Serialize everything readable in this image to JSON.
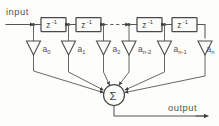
{
  "figure": {
    "kind": "block-diagram",
    "background_color": "#fdfdfc",
    "line_color": "#565656"
  },
  "io": {
    "input_label": "input",
    "output_label": "output"
  },
  "delay_blocks": [
    {
      "id": "delay-0",
      "base": "z",
      "exponent": "-1",
      "text": "z-1"
    },
    {
      "id": "delay-1",
      "base": "z",
      "exponent": "-1",
      "text": "z-1"
    },
    {
      "id": "delay-2",
      "base": "z",
      "exponent": "-1",
      "text": "z-1"
    },
    {
      "id": "delay-3",
      "base": "z",
      "exponent": "-1",
      "text": "z-1"
    }
  ],
  "continuation": {
    "style": "dashed",
    "meaning": "additional delay stages omitted"
  },
  "coefficients": [
    {
      "id": "coef-0",
      "base": "a",
      "subscript": "0",
      "text": "a0"
    },
    {
      "id": "coef-1",
      "base": "a",
      "subscript": "1",
      "text": "a1"
    },
    {
      "id": "coef-2",
      "base": "a",
      "subscript": "2",
      "text": "a2"
    },
    {
      "id": "coef-3",
      "base": "a",
      "subscript": "n-2",
      "text": "an-2"
    },
    {
      "id": "coef-4",
      "base": "a",
      "subscript": "n-1",
      "text": "an-1"
    },
    {
      "id": "coef-5",
      "base": "a",
      "subscript": "n",
      "text": "an"
    }
  ],
  "summation": {
    "symbol": "Σ",
    "name": "summing-junction",
    "input_count": 6
  }
}
